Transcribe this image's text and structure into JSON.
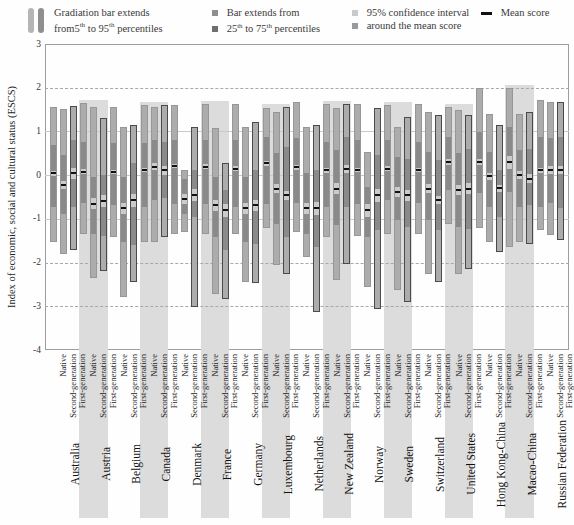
{
  "legend": {
    "item1": {
      "line1": "Gradiation bar extends",
      "line2": "from5^th^ to 95^th^ percentiles"
    },
    "item2": {
      "line1": "Bar extends from",
      "line2": "25^th^ to 75^th^ percentiles"
    },
    "item3": {
      "line1": "95% confidence interval",
      "line2": "around the mean score"
    },
    "item4": {
      "label": "Mean score"
    }
  },
  "y_axis": {
    "title": "Index of economic, social and cultural status (ESCS)",
    "ticks": [
      3,
      2,
      1,
      0,
      -1,
      -2,
      -3,
      -4
    ]
  },
  "categories_per_country": [
    "Native",
    "Second-generation",
    "First-generation"
  ],
  "colors": {
    "band": "#dcdcdc",
    "gradation": "#acacac",
    "iqr": "#8a8a8a",
    "ci": "#cbcbcb",
    "mean": "#111111",
    "legend_grad_light": "#b5b5b5",
    "legend_grad_dark": "#8f8f8f",
    "legend_bar_mid": "#8f8f8f",
    "legend_bar_dark": "#6f6f6f",
    "legend_ci_light": "#c9c9c9",
    "legend_ci_mid": "#9a9a9a"
  },
  "chart_data": {
    "type": "bar",
    "subtype": "percentile-gradation-bars",
    "ylabel": "Index of economic, social and cultural status (ESCS)",
    "ylim": [
      -4,
      3
    ],
    "grid": {
      "dashed_at": [
        2,
        -2,
        -3
      ],
      "solid_at": [
        1,
        0,
        -1
      ]
    },
    "legend_position": "top",
    "bar_fields": [
      "p5",
      "p25",
      "mean",
      "ci_halfwidth",
      "p75",
      "p95"
    ],
    "countries": [
      {
        "name": "Australia",
        "shaded": false,
        "bars": [
          {
            "group": "Native",
            "p5": -1.53,
            "p25": -0.73,
            "mean": 0.04,
            "ci": 0.05,
            "p75": 0.7,
            "p95": 1.57
          },
          {
            "group": "Second-generation",
            "p5": -1.8,
            "p25": -0.88,
            "mean": -0.23,
            "ci": 0.1,
            "p75": 0.46,
            "p95": 1.51
          },
          {
            "group": "First-generation",
            "p5": -1.72,
            "p25": -0.73,
            "mean": 0.04,
            "ci": 0.12,
            "p75": 0.8,
            "p95": 1.58
          }
        ]
      },
      {
        "name": "Austria",
        "shaded": true,
        "bars": [
          {
            "group": "Native",
            "p5": -1.34,
            "p25": -0.65,
            "mean": 0.08,
            "ci": 0.06,
            "p75": 0.76,
            "p95": 1.66
          },
          {
            "group": "Second-generation",
            "p5": -2.35,
            "p25": -1.35,
            "mean": -0.65,
            "ci": 0.12,
            "p75": -0.05,
            "p95": 1.55
          },
          {
            "group": "First-generation",
            "p5": -2.2,
            "p25": -1.4,
            "mean": -0.6,
            "ci": 0.14,
            "p75": 0.0,
            "p95": 1.3
          }
        ]
      },
      {
        "name": "Belgium",
        "shaded": false,
        "bars": [
          {
            "group": "Native",
            "p5": -1.41,
            "p25": -0.69,
            "mean": 0.08,
            "ci": 0.05,
            "p75": 0.73,
            "p95": 1.57
          },
          {
            "group": "Second-generation",
            "p5": -2.79,
            "p25": -1.53,
            "mean": -0.76,
            "ci": 0.12,
            "p75": -0.04,
            "p95": 1.11
          },
          {
            "group": "First-generation",
            "p5": -2.45,
            "p25": -1.61,
            "mean": -0.57,
            "ci": 0.15,
            "p75": 0.27,
            "p95": 1.15
          }
        ]
      },
      {
        "name": "Canada",
        "shaded": true,
        "bars": [
          {
            "group": "Native",
            "p5": -1.53,
            "p25": -0.73,
            "mean": 0.11,
            "ci": 0.05,
            "p75": 0.73,
            "p95": 1.61
          },
          {
            "group": "Second-generation",
            "p5": -1.53,
            "p25": -0.57,
            "mean": 0.19,
            "ci": 0.08,
            "p75": 0.8,
            "p95": 1.57
          },
          {
            "group": "First-generation",
            "p5": -1.41,
            "p25": -0.53,
            "mean": 0.11,
            "ci": 0.1,
            "p75": 0.76,
            "p95": 1.61
          }
        ]
      },
      {
        "name": "Denmark",
        "shaded": false,
        "bars": [
          {
            "group": "Native",
            "p5": -1.34,
            "p25": -0.65,
            "mean": 0.21,
            "ci": 0.05,
            "p75": 0.8,
            "p95": 1.61
          },
          {
            "group": "Second-generation",
            "p5": -1.3,
            "p25": -0.88,
            "mean": -0.54,
            "ci": 0.12,
            "p75": -0.08,
            "p95": 0.11
          },
          {
            "group": "First-generation",
            "p5": -3.02,
            "p25": -0.96,
            "mean": -0.46,
            "ci": 0.14,
            "p75": 0.11,
            "p95": 1.11
          }
        ]
      },
      {
        "name": "France",
        "shaded": true,
        "bars": [
          {
            "group": "Native",
            "p5": -1.34,
            "p25": -0.65,
            "mean": 0.19,
            "ci": 0.06,
            "p75": 0.8,
            "p95": 1.64
          },
          {
            "group": "Second-generation",
            "p5": -2.71,
            "p25": -1.41,
            "mean": -0.69,
            "ci": 0.12,
            "p75": -0.04,
            "p95": 1.07
          },
          {
            "group": "First-generation",
            "p5": -2.83,
            "p25": -1.72,
            "mean": -0.8,
            "ci": 0.15,
            "p75": -0.34,
            "p95": 0.27
          }
        ]
      },
      {
        "name": "Germany",
        "shaded": false,
        "bars": [
          {
            "group": "Native",
            "p5": -1.34,
            "p25": -0.73,
            "mean": 0.15,
            "ci": 0.05,
            "p75": 0.8,
            "p95": 1.64
          },
          {
            "group": "Second-generation",
            "p5": -2.45,
            "p25": -1.53,
            "mean": -0.76,
            "ci": 0.12,
            "p75": -0.04,
            "p95": 1.11
          },
          {
            "group": "First-generation",
            "p5": -2.48,
            "p25": -1.57,
            "mean": -0.69,
            "ci": 0.12,
            "p75": 0.11,
            "p95": 1.22
          }
        ]
      },
      {
        "name": "Luxembourg",
        "shaded": true,
        "bars": [
          {
            "group": "Native",
            "p5": -1.22,
            "p25": -0.65,
            "mean": 0.27,
            "ci": 0.06,
            "p75": 0.88,
            "p95": 1.53
          },
          {
            "group": "Second-generation",
            "p5": -2.06,
            "p25": -1.11,
            "mean": -0.31,
            "ci": 0.1,
            "p75": 0.5,
            "p95": 1.45
          },
          {
            "group": "First-generation",
            "p5": -2.26,
            "p25": -1.41,
            "mean": -0.46,
            "ci": 0.1,
            "p75": 0.65,
            "p95": 1.57
          }
        ]
      },
      {
        "name": "Netherlands",
        "shaded": false,
        "bars": [
          {
            "group": "Native",
            "p5": -1.3,
            "p25": -0.65,
            "mean": 0.18,
            "ci": 0.06,
            "p75": 0.84,
            "p95": 1.68
          },
          {
            "group": "Second-generation",
            "p5": -1.87,
            "p25": -1.34,
            "mean": -0.76,
            "ci": 0.13,
            "p75": 0.04,
            "p95": 1.11
          },
          {
            "group": "First-generation",
            "p5": -3.13,
            "p25": -1.64,
            "mean": -0.76,
            "ci": 0.15,
            "p75": 0.11,
            "p95": 1.15
          }
        ]
      },
      {
        "name": "New Zealand",
        "shaded": true,
        "bars": [
          {
            "group": "Native",
            "p5": -1.41,
            "p25": -0.73,
            "mean": 0.11,
            "ci": 0.06,
            "p75": 0.76,
            "p95": 1.64
          },
          {
            "group": "Second-generation",
            "p5": -2.41,
            "p25": -1.15,
            "mean": -0.31,
            "ci": 0.12,
            "p75": 0.57,
            "p95": 1.53
          },
          {
            "group": "First-generation",
            "p5": -2.03,
            "p25": -0.73,
            "mean": 0.14,
            "ci": 0.1,
            "p75": 0.88,
            "p95": 1.64
          }
        ]
      },
      {
        "name": "Norway",
        "shaded": false,
        "bars": [
          {
            "group": "Native",
            "p5": -1.38,
            "p25": -0.65,
            "mean": 0.11,
            "ci": 0.05,
            "p75": 0.8,
            "p95": 1.64
          },
          {
            "group": "Second-generation",
            "p5": -2.56,
            "p25": -1.41,
            "mean": -0.8,
            "ci": 0.15,
            "p75": -0.27,
            "p95": 0.53
          },
          {
            "group": "First-generation",
            "p5": -3.06,
            "p25": -1.26,
            "mean": -0.46,
            "ci": 0.15,
            "p75": 0.46,
            "p95": 1.53
          }
        ]
      },
      {
        "name": "Sweden",
        "shaded": true,
        "bars": [
          {
            "group": "Native",
            "p5": -1.34,
            "p25": -0.57,
            "mean": 0.15,
            "ci": 0.05,
            "p75": 0.8,
            "p95": 1.61
          },
          {
            "group": "Second-generation",
            "p5": -2.64,
            "p25": -1.03,
            "mean": -0.38,
            "ci": 0.12,
            "p75": 0.42,
            "p95": 1.11
          },
          {
            "group": "First-generation",
            "p5": -2.91,
            "p25": -1.19,
            "mean": -0.46,
            "ci": 0.12,
            "p75": 0.38,
            "p95": 1.34
          }
        ]
      },
      {
        "name": "Switzerland",
        "shaded": false,
        "bars": [
          {
            "group": "Native",
            "p5": -1.34,
            "p25": -0.65,
            "mean": 0.11,
            "ci": 0.05,
            "p75": 0.76,
            "p95": 1.64
          },
          {
            "group": "Second-generation",
            "p5": -2.26,
            "p25": -1.03,
            "mean": -0.31,
            "ci": 0.1,
            "p75": 0.53,
            "p95": 1.45
          },
          {
            "group": "First-generation",
            "p5": -2.45,
            "p25": -1.26,
            "mean": -0.57,
            "ci": 0.1,
            "p75": 0.34,
            "p95": 1.38
          }
        ]
      },
      {
        "name": "United States",
        "shaded": true,
        "bars": [
          {
            "group": "Native",
            "p5": -1.11,
            "p25": -0.34,
            "mean": 0.3,
            "ci": 0.06,
            "p75": 0.88,
            "p95": 1.57
          },
          {
            "group": "Second-generation",
            "p5": -2.26,
            "p25": -1.19,
            "mean": -0.34,
            "ci": 0.12,
            "p75": 0.5,
            "p95": 1.49
          },
          {
            "group": "First-generation",
            "p5": -2.14,
            "p25": -1.22,
            "mean": -0.31,
            "ci": 0.12,
            "p75": 0.61,
            "p95": 1.38
          }
        ]
      },
      {
        "name": "Hong Kong-China",
        "shaded": false,
        "bars": [
          {
            "group": "Native",
            "p5": -1.22,
            "p25": -0.42,
            "mean": 0.3,
            "ci": 0.06,
            "p75": 0.99,
            "p95": 1.99
          },
          {
            "group": "Second-generation",
            "p5": -1.53,
            "p25": -0.73,
            "mean": -0.02,
            "ci": 0.08,
            "p75": 0.53,
            "p95": 1.41
          },
          {
            "group": "First-generation",
            "p5": -1.76,
            "p25": -0.96,
            "mean": -0.3,
            "ci": 0.08,
            "p75": 0.11,
            "p95": 1.15
          }
        ]
      },
      {
        "name": "Macao-China",
        "shaded": true,
        "bars": [
          {
            "group": "Native",
            "p5": -1.64,
            "p25": -0.38,
            "mean": 0.3,
            "ci": 0.15,
            "p75": 1.11,
            "p95": 1.99
          },
          {
            "group": "Second-generation",
            "p5": -1.53,
            "p25": -0.73,
            "mean": 0.0,
            "ci": 0.1,
            "p75": 0.57,
            "p95": 1.41
          },
          {
            "group": "First-generation",
            "p5": -1.57,
            "p25": -0.69,
            "mean": -0.08,
            "ci": 0.1,
            "p75": 0.61,
            "p95": 1.45
          }
        ]
      },
      {
        "name": "Russian Federation",
        "shaded": false,
        "bars": [
          {
            "group": "Native",
            "p5": -1.26,
            "p25": -0.73,
            "mean": 0.11,
            "ci": 0.06,
            "p75": 0.88,
            "p95": 1.72
          },
          {
            "group": "Second-generation",
            "p5": -1.38,
            "p25": -0.65,
            "mean": 0.12,
            "ci": 0.1,
            "p75": 0.84,
            "p95": 1.68
          },
          {
            "group": "First-generation",
            "p5": -1.49,
            "p25": -0.76,
            "mean": 0.12,
            "ci": 0.1,
            "p75": 0.88,
            "p95": 1.68
          }
        ]
      }
    ]
  }
}
